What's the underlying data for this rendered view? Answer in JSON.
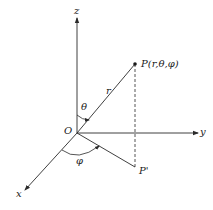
{
  "diagram": {
    "type": "spherical-coordinate-system",
    "axes": {
      "z_label": "z",
      "y_label": "y",
      "x_label": "x"
    },
    "origin_label": "O",
    "point_label": "P(r,θ,φ)",
    "projection_label": "P'",
    "radius_label": "r",
    "polar_angle_label": "θ",
    "azimuth_angle_label": "φ",
    "colors": {
      "stroke": "#2a2a2a",
      "background": "#ffffff"
    }
  }
}
